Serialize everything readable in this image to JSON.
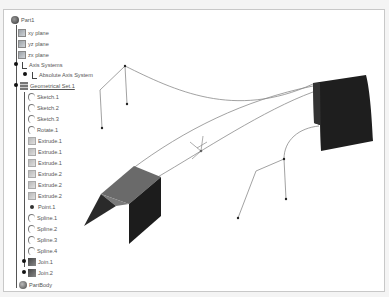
{
  "tree": {
    "root": {
      "label": "Part1",
      "icon": "part-icon"
    },
    "items": [
      {
        "label": "xy plane",
        "icon": "plane-icon"
      },
      {
        "label": "yz plane",
        "icon": "plane-icon"
      },
      {
        "label": "zx plane",
        "icon": "plane-icon"
      },
      {
        "label": "Axis Systems",
        "icon": "axis-icon"
      },
      {
        "label": "Absolute Axis System",
        "icon": "axis-icon"
      },
      {
        "label": "Geometrical Set.1",
        "icon": "geometrical-set-icon"
      },
      {
        "label": "Sketch.1",
        "icon": "sketch-icon"
      },
      {
        "label": "Sketch.2",
        "icon": "sketch-icon"
      },
      {
        "label": "Sketch.3",
        "icon": "sketch-icon"
      },
      {
        "label": "Rotate.1",
        "icon": "sketch-icon"
      },
      {
        "label": "Extrude.1",
        "icon": "extrude-icon"
      },
      {
        "label": "Extrude.1",
        "icon": "extrude-icon"
      },
      {
        "label": "Extrude.1",
        "icon": "extrude-icon"
      },
      {
        "label": "Extrude.2",
        "icon": "extrude-icon"
      },
      {
        "label": "Extrude.2",
        "icon": "extrude-icon"
      },
      {
        "label": "Extrude.2",
        "icon": "extrude-icon"
      },
      {
        "label": "Point.1",
        "icon": "point-icon"
      },
      {
        "label": "Spline.1",
        "icon": "spline-icon"
      },
      {
        "label": "Spline.2",
        "icon": "spline-icon"
      },
      {
        "label": "Spline.3",
        "icon": "spline-icon"
      },
      {
        "label": "Spline.4",
        "icon": "spline-icon"
      },
      {
        "label": "Join.1",
        "icon": "join-icon"
      },
      {
        "label": "Join.2",
        "icon": "join-icon"
      },
      {
        "label": "PartBody",
        "icon": "body-icon"
      }
    ]
  },
  "colors": {
    "surface_dark": "#1e1e1e",
    "surface_top": "#5a5a5a",
    "curve": "#8a8a8a",
    "background": "#ffffff"
  }
}
